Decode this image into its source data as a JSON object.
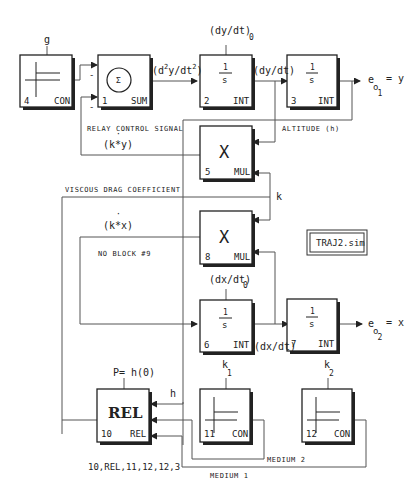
{
  "title_box": "TRAJ2.sim",
  "blocks": {
    "b4": {
      "num": "4",
      "type": "CON",
      "param": "g"
    },
    "b1": {
      "num": "1",
      "type": "SUM",
      "symbol": "Σ"
    },
    "b2": {
      "num": "2",
      "type": "INT",
      "num_top": "1",
      "den": "s",
      "param": "(dy/dt)",
      "param_sub": "0"
    },
    "b3": {
      "num": "3",
      "type": "INT",
      "num_top": "1",
      "den": "s"
    },
    "b5": {
      "num": "5",
      "type": "MUL",
      "symbol": "X"
    },
    "b8": {
      "num": "8",
      "type": "MUL",
      "symbol": "X"
    },
    "b6": {
      "num": "6",
      "type": "INT",
      "num_top": "1",
      "den": "s",
      "param": "(dx/dt)",
      "param_sub": "0"
    },
    "b7": {
      "num": "7",
      "type": "INT",
      "num_top": "1",
      "den": "s"
    },
    "b10": {
      "num": "10",
      "type": "REL",
      "symbol": "REL",
      "param": "P= h(0)"
    },
    "b11": {
      "num": "11",
      "type": "CON",
      "param": "k",
      "param_sub": "1"
    },
    "b12": {
      "num": "12",
      "type": "CON",
      "param": "k",
      "param_sub": "2"
    }
  },
  "signals": {
    "d2y": "(d",
    "d2y_sup1": "2",
    "d2y_mid": "y/dt",
    "d2y_sup2": "2",
    "d2y_end": ")",
    "dydt": "(dy/dt)",
    "out1": "e",
    "out1_sub": "o",
    "out1_subsub": "1",
    "out1_eq": "= y",
    "out2": "e",
    "out2_sub": "o",
    "out2_subsub": "2",
    "out2_eq": "= x",
    "dxdt": "(dx/dt)",
    "kdoty": "(k*y)",
    "kdotx": "(k*x)",
    "k": "k",
    "h": "h",
    "minus1": "-",
    "minus2": "-"
  },
  "labels": {
    "relay": "RELAY CONTROL SIGNAL",
    "altitude": "ALTITUDE (h)",
    "viscous": "VISCOUS DRAG COEFFICIENT",
    "no_block": "NO BLOCK #9",
    "medium2": "MEDIUM 2",
    "medium1": "MEDIUM 1",
    "rel_config": "10,REL,11,12,12,3"
  }
}
